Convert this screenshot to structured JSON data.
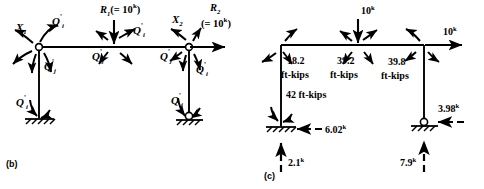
{
  "figure": {
    "parts": [
      {
        "id": "b",
        "label": "(b)",
        "caption": "Redundant forces and member end moments"
      },
      {
        "id": "c",
        "label": "(c)",
        "caption": "Final moments and support reactions"
      }
    ]
  },
  "part_b": {
    "label": "(b)",
    "redundants": [
      {
        "name": "X1",
        "base": "X",
        "sub": "1",
        "x": 22,
        "y": 27
      },
      {
        "name": "X2",
        "base": "X",
        "sub": "2",
        "x": 178,
        "y": 18
      }
    ],
    "applied_loads": [
      {
        "name": "R1",
        "base": "R",
        "sub": "1",
        "value": "(= 10",
        "unit": "k",
        "value_close": ")",
        "direction": "down",
        "x": 118,
        "y": 8
      },
      {
        "name": "R2",
        "base": "R",
        "sub": "2",
        "value": "(= 10",
        "unit": "k",
        "value_close": ")",
        "direction": "right",
        "x": 212,
        "y": 10
      }
    ],
    "moment_labels": [
      {
        "name": "Q-i-prime-joint1-top",
        "base": "Q",
        "sub": "i",
        "prime": "'",
        "x": 52,
        "y": 20
      },
      {
        "name": "Q-j-prime-joint1-col",
        "base": "Q",
        "sub": "j",
        "prime": "'",
        "x": 47,
        "y": 63
      },
      {
        "name": "Q-i-prime-joint1-base",
        "base": "Q",
        "sub": "i",
        "prime": "'",
        "x": 20,
        "y": 108
      },
      {
        "name": "Q-i-prime-joint2-right",
        "base": "Q",
        "sub": "i",
        "prime": "'",
        "x": 131,
        "y": 29
      },
      {
        "name": "Q-j-prime-joint2-left",
        "base": "Q",
        "sub": "j",
        "prime": "'",
        "x": 96,
        "y": 53
      },
      {
        "name": "Q-j-prime-joint3-left",
        "base": "Q",
        "sub": "j",
        "prime": "'",
        "x": 164,
        "y": 54
      },
      {
        "name": "Q-i-prime-joint3-col",
        "base": "Q",
        "sub": "i",
        "prime": "'",
        "x": 198,
        "y": 66
      },
      {
        "name": "Q-j-prime-joint3-base",
        "base": "Q",
        "sub": "j",
        "prime": "'",
        "x": 175,
        "y": 105
      }
    ],
    "supports": [
      {
        "name": "fixed-support-left",
        "type": "fixed",
        "x": 61,
        "y": 152
      },
      {
        "name": "pinned-support-right",
        "type": "pinned",
        "x": 213,
        "y": 152
      }
    ]
  },
  "part_c": {
    "label": "(c)",
    "member_moments": [
      {
        "name": "moment-joint-left-beam",
        "value": "18.2",
        "unit": "ft-kips",
        "x": 291,
        "y": 61
      },
      {
        "name": "moment-joint-mid",
        "value": "39.2",
        "unit": "ft-kips",
        "x": 340,
        "y": 61
      },
      {
        "name": "moment-joint-right",
        "value": "39.8",
        "unit": "ft-kips",
        "x": 392,
        "y": 61
      },
      {
        "name": "moment-column-left",
        "value": "42 ft-kips",
        "unit": "",
        "x": 288,
        "y": 88
      }
    ],
    "loads": [
      {
        "name": "vertical-load-mid",
        "value": "10",
        "unit": "k",
        "direction": "down",
        "x": 371,
        "y": 8
      },
      {
        "name": "horizontal-load-right",
        "value": "10",
        "unit": "k",
        "direction": "right",
        "x": 450,
        "y": 28
      }
    ],
    "reactions": [
      {
        "name": "horizontal-reaction-left",
        "value": "6.02",
        "unit": "k",
        "direction": "left",
        "x": 295,
        "y": 129
      },
      {
        "name": "vertical-reaction-left",
        "value": "2.1",
        "unit": "k",
        "direction": "up",
        "x": 292,
        "y": 162
      },
      {
        "name": "horizontal-reaction-right",
        "value": "3.98",
        "unit": "k",
        "direction": "left",
        "x": 437,
        "y": 106
      },
      {
        "name": "vertical-reaction-right",
        "value": "7.9",
        "unit": "k",
        "direction": "up",
        "x": 410,
        "y": 160
      }
    ],
    "supports": [
      {
        "name": "fixed-support-left-c",
        "type": "fixed",
        "x": 278,
        "y": 126
      },
      {
        "name": "pinned-support-right-c",
        "type": "pinned",
        "x": 419,
        "y": 123
      }
    ]
  }
}
